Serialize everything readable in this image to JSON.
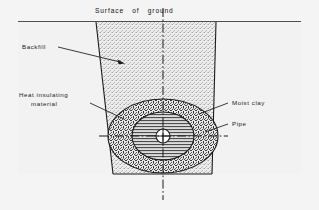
{
  "figure": {
    "kind": "engineering-cross-section",
    "canvas": {
      "width": 319,
      "height": 210
    },
    "background_color": "#f4f4f4",
    "line_color": "#1a1a1a"
  },
  "labels": {
    "title": "Surface   of   ground",
    "backfill": "Backfill",
    "heat_insulating_line1": "Heat insulating",
    "heat_insulating_line2": "material",
    "moist_clay": "Moist clay",
    "pipe": "Pipe"
  },
  "regions": [
    {
      "name": "backfill",
      "label": "Backfill",
      "fill_style": "fine-stipple",
      "fill_color": "#d2d2d2",
      "description": "Trapezoidal trench filled above the insulation"
    },
    {
      "name": "heat-insulating-material",
      "label": "Heat insulating material",
      "fill_style": "coarse-stipple",
      "fill_color": "#8a8a8a",
      "description": "Outer ellipse surrounding the clay core"
    },
    {
      "name": "moist-clay",
      "label": "Moist clay",
      "fill_style": "horizontal-hatch",
      "fill_color": "#9b9b9b",
      "description": "Inner ellipse immediately around the pipe"
    },
    {
      "name": "pipe",
      "label": "Pipe",
      "fill_style": "solid-white",
      "fill_color": "#ffffff",
      "description": "Small circle at the centre with centre-mark crosshair"
    }
  ],
  "geometry": {
    "ground_line": {
      "x1": 18,
      "x2": 301,
      "y": 22
    },
    "trench": {
      "top_left_x": 96,
      "top_right_x": 216,
      "bottom_left_x": 113,
      "bottom_right_x": 212,
      "top_y": 22,
      "bottom_y": 174
    },
    "vertical_centerline": {
      "x": 163,
      "y1": 8,
      "y2": 200,
      "style": "dash-dot"
    },
    "horizontal_centerline": {
      "y": 136,
      "x1": 99,
      "x2": 228,
      "style": "dash-dot"
    },
    "outer_ellipse": {
      "cx": 163,
      "cy": 136,
      "rx": 55,
      "ry": 37
    },
    "inner_ellipse": {
      "cx": 163,
      "cy": 136,
      "rx": 31,
      "ry": 24
    },
    "pipe_circle": {
      "cx": 163,
      "cy": 136,
      "r": 7
    }
  },
  "leaders": [
    {
      "name": "backfill-leader",
      "from_x": 58,
      "from_y": 47,
      "to_x": 124,
      "to_y": 63,
      "arrow": true
    },
    {
      "name": "heat-insulating-leader",
      "from_x": 90,
      "from_y": 103,
      "to_x": 124,
      "to_y": 119,
      "arrow": false
    },
    {
      "name": "moist-clay-leader",
      "from_x": 228,
      "from_y": 103,
      "to_x": 199,
      "to_y": 114,
      "arrow": false
    },
    {
      "name": "pipe-leader",
      "from_x": 228,
      "from_y": 124,
      "to_x": 205,
      "to_y": 132,
      "arrow": false
    }
  ]
}
